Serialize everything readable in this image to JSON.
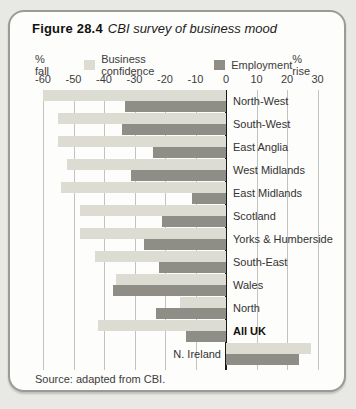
{
  "figure": {
    "label": "Figure 28.4",
    "title": "CBI survey of business mood",
    "source": "Source: adapted from CBI."
  },
  "legend": {
    "left_axis_label": "% fall",
    "right_axis_label": "% rise",
    "items": [
      {
        "label": "Business confidence"
      },
      {
        "label": "Employment"
      }
    ]
  },
  "chart_data": {
    "type": "bar",
    "orientation": "horizontal",
    "title": "CBI survey of business mood",
    "xlabel_left": "% fall",
    "xlabel_right": "% rise",
    "xlim": [
      -60,
      32
    ],
    "x_ticks": [
      -60,
      -50,
      -40,
      -30,
      -20,
      -10,
      0,
      10,
      20,
      30
    ],
    "grid": true,
    "categories": [
      "North-West",
      "South-West",
      "East Anglia",
      "West Midlands",
      "East Midlands",
      "Scotland",
      "Yorks & Humberside",
      "South-East",
      "Wales",
      "North",
      "All UK",
      "N. Ireland"
    ],
    "series": [
      {
        "name": "Business confidence",
        "color": "#dcdcd2",
        "values": [
          -60,
          -55,
          -55,
          -52,
          -54,
          -48,
          -48,
          -43,
          -36,
          -15,
          -42,
          28
        ]
      },
      {
        "name": "Employment",
        "color": "#8e8e86",
        "values": [
          -33,
          -34,
          -24,
          -31,
          -11,
          -21,
          -27,
          -22,
          -37,
          -23,
          -13,
          24
        ]
      }
    ],
    "bold_categories": [
      "All UK"
    ],
    "label_left_of_zero": [
      "N. Ireland"
    ]
  },
  "colors": {
    "page_background": "#e8e8e4",
    "panel_background": "#fdfdfb",
    "panel_border": "#9a9a98",
    "gridline": "#c2c2be",
    "zero_line": "#1a1a1a"
  }
}
